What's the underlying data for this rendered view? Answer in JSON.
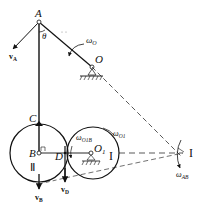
{
  "diagram": {
    "points": {
      "A": "A",
      "O": "O",
      "C": "C",
      "B": "B",
      "D": "D",
      "O1": "O",
      "O1_sub": "1",
      "I": "I"
    },
    "angle": "θ",
    "wheels": {
      "left": "Ⅱ",
      "right": "I"
    },
    "angular_velocities": {
      "omega_O": {
        "base": "ω",
        "sub": "O"
      },
      "omega_O1": {
        "base": "ω",
        "sub": "O1"
      },
      "omega_O1B": {
        "base": "ω",
        "sub": "O1B"
      },
      "omega_AB": {
        "base": "ω",
        "sub": "AB"
      }
    },
    "velocities": {
      "vA": {
        "base": "v",
        "sub": "A"
      },
      "vB": {
        "base": "v",
        "sub": "B"
      },
      "vD": {
        "base": "v",
        "sub": "D"
      }
    }
  }
}
